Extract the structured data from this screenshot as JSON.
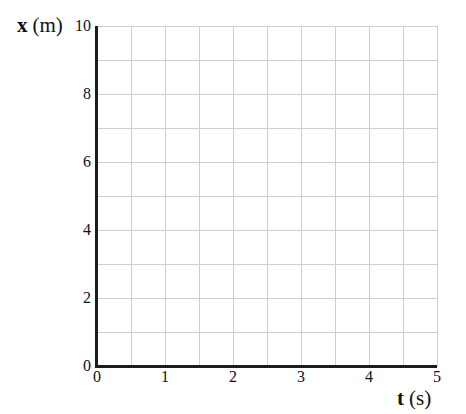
{
  "figure": {
    "ylabel": {
      "symbol": "x",
      "unit": "(m)"
    },
    "xlabel": {
      "symbol": "t",
      "unit": "(s)"
    }
  },
  "chart_data": {
    "type": "line",
    "title": "",
    "xlabel": "t (s)",
    "ylabel": "x (m)",
    "xlim": [
      0,
      5
    ],
    "ylim": [
      0,
      10
    ],
    "xticks": [
      0,
      1,
      2,
      3,
      4,
      5
    ],
    "yticks": [
      0,
      2,
      4,
      6,
      8,
      10
    ],
    "x_gridline_interval": 0.5,
    "y_gridline_interval": 1,
    "grid": true,
    "series": [],
    "colors": {
      "background": "#ffffff",
      "axis": "#1c1c1c",
      "gridline": "#cfcfcf",
      "text": "#111111"
    }
  }
}
